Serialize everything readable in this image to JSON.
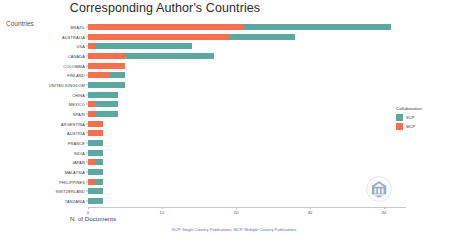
{
  "chart_data": {
    "type": "bar",
    "orientation": "horizontal",
    "stacked": true,
    "title": "Corresponding Author's Countries",
    "xlabel": "N. of Documents",
    "ylabel": "Countries",
    "xlim": [
      0,
      43
    ],
    "xticks": [
      0,
      10,
      20,
      30,
      40
    ],
    "xtick_labels": [
      "0",
      "10",
      "20",
      "30",
      "40"
    ],
    "grid": false,
    "legend": {
      "title": "Collaboration",
      "position": "right",
      "entries": [
        {
          "name": "SCP",
          "color": "#5CA8A0"
        },
        {
          "name": "MCP",
          "color": "#F4704E"
        }
      ]
    },
    "categories": [
      "BRAZIL",
      "AUSTRALIA",
      "USA",
      "CANADA",
      "COLOMBIA",
      "FINLAND",
      "UNITED KINGDOM",
      "CHINA",
      "MEXICO",
      "SPAIN",
      "ARGENTINA",
      "AUSTRIA",
      "FRANCE",
      "INDIA",
      "JAPAN",
      "MALAYSIA",
      "PHILIPPINES",
      "SWITZERLAND",
      "TANZANIA"
    ],
    "series": [
      {
        "name": "MCP",
        "color": "#F4704E",
        "values": [
          21,
          19,
          1,
          5,
          5,
          3,
          0,
          0,
          1,
          1,
          2,
          2,
          0,
          0,
          1,
          0,
          1,
          0,
          0
        ]
      },
      {
        "name": "SCP",
        "color": "#5CA8A0",
        "values": [
          20,
          9,
          13,
          12,
          0,
          2,
          5,
          4,
          3,
          3,
          0,
          0,
          2,
          2,
          1,
          2,
          1,
          2,
          2
        ]
      }
    ],
    "totals": [
      41,
      28,
      14,
      17,
      5,
      5,
      5,
      4,
      4,
      4,
      2,
      2,
      2,
      2,
      2,
      2,
      2,
      2,
      2
    ],
    "caption": "SCP: Single Country Publications, MCP: Multiple Country Publications",
    "watermark": "bibliometrix-logo"
  }
}
